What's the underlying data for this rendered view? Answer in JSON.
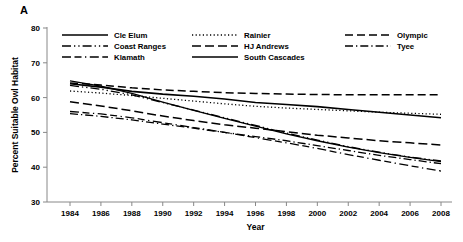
{
  "panel": {
    "label": "A"
  },
  "chart_data": {
    "type": "line",
    "title": "",
    "xlabel": "Year",
    "ylabel": "Percent Suitable Owl Habitat",
    "xlim": [
      1983,
      2009
    ],
    "ylim": [
      30,
      80
    ],
    "xticks": [
      1984,
      1986,
      1988,
      1990,
      1992,
      1994,
      1996,
      1998,
      2000,
      2002,
      2004,
      2006,
      2008
    ],
    "yticks": [
      30,
      40,
      50,
      60,
      70,
      80
    ],
    "grid": false,
    "legend_position": "top-inside",
    "x": [
      1984,
      1986,
      1988,
      1990,
      1992,
      1994,
      1996,
      1998,
      2000,
      2002,
      2004,
      2006,
      2008
    ],
    "series": [
      {
        "name": "Cle Elum",
        "dash": "none",
        "width": 1.3,
        "values": [
          64.8,
          63.3,
          61.2,
          58.7,
          56.3,
          54.0,
          51.8,
          49.6,
          47.6,
          45.8,
          44.2,
          42.8,
          41.6
        ]
      },
      {
        "name": "Coast Ranges",
        "dash": "long-dot-dot",
        "width": 1.3,
        "values": [
          63.5,
          62.4,
          60.8,
          58.6,
          56.4,
          54.2,
          52.0,
          49.8,
          47.8,
          45.9,
          44.3,
          42.9,
          41.8
        ]
      },
      {
        "name": "Klamath",
        "dash": "long-dash-dot",
        "width": 1.3,
        "values": [
          56.0,
          55.3,
          54.2,
          52.8,
          51.4,
          50.0,
          48.5,
          47.0,
          45.4,
          43.6,
          42.0,
          40.4,
          38.9
        ]
      },
      {
        "name": "Rainier",
        "dash": "dotted",
        "width": 1.3,
        "values": [
          61.9,
          61.3,
          60.6,
          59.8,
          59.0,
          58.2,
          57.5,
          57.0,
          56.6,
          56.2,
          55.8,
          55.5,
          55.2
        ]
      },
      {
        "name": "HJ Andrews",
        "dash": "dash",
        "width": 1.5,
        "values": [
          58.8,
          57.6,
          56.2,
          54.7,
          53.4,
          52.2,
          51.2,
          50.2,
          49.2,
          48.4,
          47.6,
          47.0,
          46.4
        ]
      },
      {
        "name": "South Cascades",
        "dash": "none",
        "width": 1.6,
        "values": [
          64.0,
          63.0,
          61.8,
          61.0,
          60.4,
          59.6,
          58.6,
          58.0,
          57.4,
          56.6,
          55.8,
          55.0,
          54.2
        ]
      },
      {
        "name": "Olympic",
        "dash": "dash-long",
        "width": 1.5,
        "values": [
          64.2,
          63.6,
          62.8,
          62.2,
          61.8,
          61.4,
          61.2,
          61.0,
          60.9,
          60.8,
          60.8,
          60.8,
          60.8
        ]
      },
      {
        "name": "Tyee",
        "dash": "dash-dot",
        "width": 1.3,
        "values": [
          55.4,
          54.6,
          53.6,
          52.4,
          51.2,
          50.0,
          48.8,
          47.6,
          46.2,
          44.8,
          43.4,
          42.2,
          41.0
        ]
      }
    ]
  },
  "legend": {
    "columns": [
      [
        {
          "label": "Cle Elum",
          "dash": "none",
          "width": 1.3
        },
        {
          "label": "Coast Ranges",
          "dash": "long-dot-dot",
          "width": 1.3
        },
        {
          "label": "Klamath",
          "dash": "long-dash-dot",
          "width": 1.3
        }
      ],
      [
        {
          "label": "Rainier",
          "dash": "dotted",
          "width": 1.3
        },
        {
          "label": "HJ Andrews",
          "dash": "dash",
          "width": 1.5
        },
        {
          "label": "South Cascades",
          "dash": "none",
          "width": 1.6
        }
      ],
      [
        {
          "label": "Olympic",
          "dash": "dash-long",
          "width": 1.5
        },
        {
          "label": "Tyee",
          "dash": "dash-dot",
          "width": 1.3
        }
      ]
    ]
  },
  "colors": {
    "line": "#000000",
    "axis": "#888888",
    "background": "#ffffff"
  }
}
